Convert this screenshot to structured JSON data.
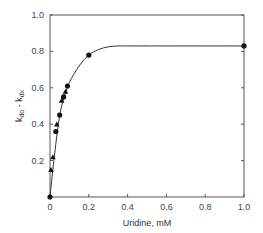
{
  "chart_data": {
    "type": "scatter",
    "title": "",
    "xlabel": "Uridine, mM",
    "ylabel": "k_do - k_dx",
    "ylabel_parts": {
      "k1": "k",
      "s1": "do",
      "mid": " - ",
      "k2": "k",
      "s2": "dx"
    },
    "xlim": [
      0,
      1.0
    ],
    "ylim": [
      0,
      1.0
    ],
    "xticks": [
      "0",
      "0.2",
      "0.4",
      "0.6",
      "0.8",
      "1.0"
    ],
    "xtick_values": [
      0,
      0.2,
      0.4,
      0.6,
      0.8,
      1.0
    ],
    "yticks": [
      "0.2",
      "0.4",
      "0.6",
      "0.8",
      "1.0"
    ],
    "ytick_values": [
      0.2,
      0.4,
      0.6,
      0.8,
      1.0
    ],
    "grid": false,
    "legend": "none",
    "series": [
      {
        "name": "circles",
        "marker": "circle",
        "x": [
          0,
          0.03,
          0.05,
          0.07,
          0.09,
          0.2,
          1.0
        ],
        "y": [
          0,
          0.36,
          0.45,
          0.55,
          0.61,
          0.78,
          0.83
        ]
      },
      {
        "name": "triangles",
        "marker": "triangle",
        "x": [
          0.005,
          0.015,
          0.035,
          0.06,
          0.08
        ],
        "y": [
          0.15,
          0.22,
          0.4,
          0.53,
          0.58
        ]
      }
    ],
    "fit_curve": {
      "description": "saturating fit",
      "x": [
        0,
        0.02,
        0.05,
        0.08,
        0.1,
        0.15,
        0.2,
        0.25,
        0.3,
        0.35,
        0.4,
        0.5,
        0.6,
        0.8,
        1.0
      ],
      "y": [
        0,
        0.2,
        0.45,
        0.57,
        0.63,
        0.72,
        0.78,
        0.81,
        0.825,
        0.83,
        0.83,
        0.83,
        0.83,
        0.83,
        0.83
      ]
    }
  }
}
